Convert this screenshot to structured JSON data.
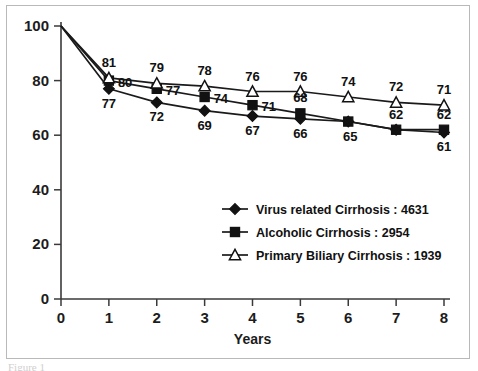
{
  "caption": "Figure 1",
  "chart_data": {
    "type": "line",
    "title": "",
    "xlabel": "Years",
    "ylabel": "",
    "x": [
      0,
      1,
      2,
      3,
      4,
      5,
      6,
      7,
      8
    ],
    "categories": [
      "0",
      "1",
      "2",
      "3",
      "4",
      "5",
      "6",
      "7",
      "8"
    ],
    "xticklabels": [
      "0",
      "1",
      "2",
      "3",
      "4",
      "5",
      "6",
      "7",
      "8"
    ],
    "yticklabels": [
      "0",
      "20",
      "40",
      "60",
      "80",
      "100"
    ],
    "yticks": [
      0,
      20,
      40,
      60,
      80,
      100
    ],
    "xlim": [
      0,
      8
    ],
    "ylim": [
      0,
      100
    ],
    "grid": false,
    "legend_position": "lower-right-inside",
    "series": [
      {
        "name": "Virus related Cirrhosis : 4631",
        "marker": "filled-diamond",
        "color": "#121212",
        "values": [
          100,
          77,
          72,
          69,
          67,
          66,
          65,
          62,
          61
        ],
        "labels": [
          "",
          "77",
          "72",
          "69",
          "67",
          "66",
          "65",
          "62",
          "61"
        ],
        "label_positions": [
          "",
          "below",
          "below",
          "below",
          "below",
          "below",
          "below-right",
          "above",
          "below"
        ]
      },
      {
        "name": "Alcoholic Cirrhosis : 2954",
        "marker": "filled-square",
        "color": "#121212",
        "values": [
          100,
          80,
          77,
          74,
          71,
          68,
          65,
          62,
          62
        ],
        "labels": [
          "",
          "80",
          "77",
          "74",
          "71",
          "68",
          "",
          "",
          "62"
        ],
        "label_positions": [
          "",
          "right",
          "right",
          "right",
          "right",
          "above",
          "",
          "",
          "above"
        ]
      },
      {
        "name": "Primary Biliary Cirrhosis : 1939",
        "marker": "open-triangle",
        "color": "#121212",
        "values": [
          100,
          81,
          79,
          78,
          76,
          76,
          74,
          72,
          71
        ],
        "labels": [
          "",
          "81",
          "79",
          "78",
          "76",
          "76",
          "74",
          "72",
          "71"
        ],
        "label_positions": [
          "",
          "above",
          "above",
          "above",
          "above",
          "above",
          "above",
          "above",
          "above"
        ]
      }
    ]
  },
  "legend": {
    "entries": [
      {
        "label": "Virus related Cirrhosis : 4631",
        "marker": "filled-diamond"
      },
      {
        "label": "Alcoholic Cirrhosis : 2954",
        "marker": "filled-square"
      },
      {
        "label": "Primary Biliary Cirrhosis : 1939",
        "marker": "open-triangle"
      }
    ]
  }
}
